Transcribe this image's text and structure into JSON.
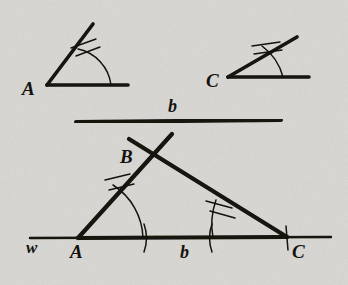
{
  "figure": {
    "background_color": "#d8d6d2",
    "ink_color": "#14120f",
    "width": 348,
    "height": 285
  },
  "given_angle_a": {
    "vertex_label": "A",
    "vertex_label_x": 22,
    "vertex_label_y": 95,
    "vertex_x": 47,
    "vertex_y": 85,
    "horizontal_ray_end_x": 128,
    "horizontal_ray_end_y": 85,
    "slanted_ray_end_x": 93,
    "slanted_ray_end_y": 24,
    "arc_path": "M 111 85 A 42 42 0 0 0 78 49",
    "tick_one": "M 71 48 L 96 39",
    "tick_two": "M 76 56 L 100 47"
  },
  "given_angle_c": {
    "vertex_label": "C",
    "vertex_label_x": 206,
    "vertex_label_y": 87,
    "vertex_x": 228,
    "vertex_y": 77,
    "horizontal_ray_end_x": 309,
    "horizontal_ray_end_y": 77,
    "slanted_ray_end_x": 297,
    "slanted_ray_end_y": 37,
    "arc_path": "M 283 77 A 56 56 0 0 0 262 46",
    "tick_one": "M 252 46 L 280 42",
    "tick_two": "M 254 54 L 282 50"
  },
  "given_segment_b": {
    "label": "b",
    "label_x": 168,
    "label_y": 112,
    "start_x": 76,
    "start_y": 122,
    "end_x": 281,
    "end_y": 120
  },
  "triangle": {
    "baseline_label": "w",
    "baseline_label_x": 26,
    "baseline_label_y": 253,
    "baseline_start_x": 30,
    "baseline_start_y": 238,
    "baseline_end_x": 331,
    "baseline_end_y": 237,
    "vertex_a_label": "A",
    "vertex_a_label_x": 70,
    "vertex_a_label_y": 258,
    "vertex_a_x": 78,
    "vertex_a_y": 238,
    "vertex_b_label": "B",
    "vertex_b_label_x": 120,
    "vertex_b_label_y": 163,
    "vertex_b_x": 152,
    "vertex_b_y": 152,
    "vertex_c_label": "C",
    "vertex_c_label_x": 292,
    "vertex_c_label_y": 258,
    "vertex_c_x": 287,
    "vertex_c_y": 237,
    "side_b_label": "b",
    "side_b_label_x": 180,
    "side_b_label_y": 258,
    "ray_ab_end_x": 172,
    "ray_ab_end_y": 134,
    "ray_cb_end_x": 129,
    "ray_cb_end_y": 139,
    "angle_a_arc": "M 143 238 A 65 65 0 0 0 113 185",
    "angle_a_tick_one": "M 105 180 L 130 174",
    "angle_a_tick_two": "M 109 190 L 134 184",
    "angle_c_arc": "M 213 238 A 74 74 0 0 1 216 200",
    "angle_c_tick_one": "M 206 201 L 232 208",
    "angle_c_tick_two": "M 210 211 L 235 218",
    "base_tick_near_a": "M 144 224 Q 149 238 144 252",
    "base_tick_near_c": "M 212 224 Q 207 238 212 252",
    "endpoint_tick_c": "M 286 226 L 288 250"
  }
}
